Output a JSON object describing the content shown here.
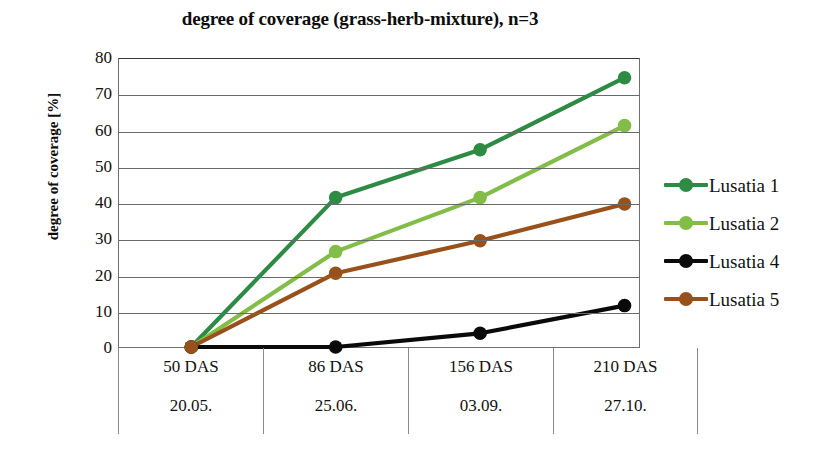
{
  "chart_data": {
    "type": "line",
    "title": "degree of coverage (grass-herb-mixture), n=3",
    "xlabel": "",
    "ylabel": "degree of coverage [%]",
    "ylim": [
      0,
      80
    ],
    "yticks": [
      0,
      10,
      20,
      30,
      40,
      50,
      60,
      70,
      80
    ],
    "ytick_labels": [
      "0",
      "10",
      "20",
      "30",
      "40",
      "50",
      "60",
      "70",
      "80"
    ],
    "grid": true,
    "legend_position": "right",
    "categories": [
      "50 DAS",
      "86 DAS",
      "156 DAS",
      "210 DAS"
    ],
    "category_dates": [
      "20.05.",
      "25.06.",
      "03.09.",
      "27.10."
    ],
    "series": [
      {
        "name": "Lusatia 1",
        "color": "#2e8b44",
        "values": [
          0,
          41.5,
          54.8,
          74.8
        ]
      },
      {
        "name": "Lusatia 2",
        "color": "#82bd47",
        "values": [
          0,
          26.5,
          41.5,
          61.5
        ]
      },
      {
        "name": "Lusatia 4",
        "color": "#0a0a0a",
        "values": [
          0,
          0,
          3.8,
          11.5
        ]
      },
      {
        "name": "Lusatia 5",
        "color": "#98511b",
        "values": [
          0,
          20.5,
          29.5,
          39.7
        ]
      }
    ]
  },
  "axes": {
    "y_title": "degree of coverage [%]"
  },
  "legend": {
    "items": [
      {
        "label": "Lusatia 1"
      },
      {
        "label": "Lusatia 2"
      },
      {
        "label": "Lusatia 4"
      },
      {
        "label": "Lusatia 5"
      }
    ]
  }
}
